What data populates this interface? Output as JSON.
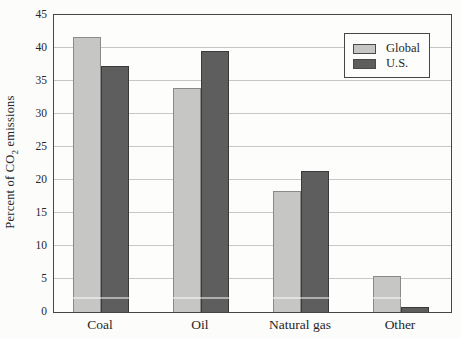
{
  "chart_data": {
    "type": "bar",
    "title": "",
    "xlabel": "",
    "ylabel": "Percent of CO₂ emissions",
    "ylabel_parts": {
      "prefix": "Percent of CO",
      "sub": "2",
      "suffix": " emissions"
    },
    "categories": [
      "Coal",
      "Oil",
      "Natural gas",
      "Other"
    ],
    "series": [
      {
        "name": "Global",
        "color": "#c6c6c4",
        "border_color": "#8a8a88",
        "values": [
          41.7,
          34.0,
          18.3,
          5.5
        ]
      },
      {
        "name": "U.S.",
        "color": "#5e5e5e",
        "border_color": "#3a3a3a",
        "values": [
          37.3,
          39.5,
          21.4,
          0.7
        ]
      }
    ],
    "ylim": [
      0,
      45
    ],
    "ytick_step": 5,
    "yticks": [
      0,
      5,
      10,
      15,
      20,
      25,
      30,
      35,
      40,
      45
    ],
    "grid": true,
    "gridline_color": "#c7c7c5",
    "axis_color": "#464646",
    "legend_position": "top-right"
  }
}
